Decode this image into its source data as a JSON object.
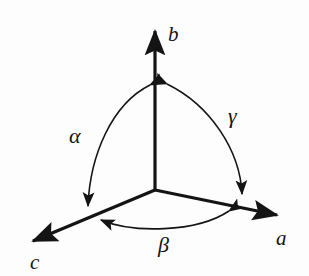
{
  "figure": {
    "background_color": "#fdfdfd",
    "stroke_color": "#141414",
    "axis_stroke_width": 3.2,
    "arc_stroke_width": 1.6
  },
  "axes": [
    {
      "id": "a",
      "label": "a",
      "direction": "lower-right",
      "origin": {
        "x": 155,
        "y": 190
      },
      "tip": {
        "x": 286,
        "y": 217
      },
      "label_position": {
        "x": 276,
        "y": 228
      }
    },
    {
      "id": "b",
      "label": "b",
      "direction": "up",
      "origin": {
        "x": 155,
        "y": 190
      },
      "tip": {
        "x": 155,
        "y": 22
      },
      "label_position": {
        "x": 168,
        "y": 24
      }
    },
    {
      "id": "c",
      "label": "c",
      "direction": "lower-left",
      "origin": {
        "x": 155,
        "y": 190
      },
      "tip": {
        "x": 24,
        "y": 245
      },
      "label_position": {
        "x": 30,
        "y": 252
      }
    }
  ],
  "angles": [
    {
      "id": "alpha",
      "label": "α",
      "between": [
        "b",
        "c"
      ],
      "arc_from": {
        "x": 150,
        "y": 78
      },
      "arc_to": {
        "x": 88,
        "y": 214
      },
      "bulge": "left",
      "arrowheads": [
        "both"
      ],
      "label_position": {
        "x": 69,
        "y": 125
      }
    },
    {
      "id": "beta",
      "label": "β",
      "between": [
        "c",
        "a"
      ],
      "arc_from": {
        "x": 236,
        "y": 209
      },
      "arc_to": {
        "x": 94,
        "y": 219
      },
      "bulge": "down",
      "arrowheads": [
        "both"
      ],
      "label_position": {
        "x": 158,
        "y": 234
      }
    },
    {
      "id": "gamma",
      "label": "γ",
      "between": [
        "b",
        "a"
      ],
      "arc_from": {
        "x": 161,
        "y": 78
      },
      "arc_to": {
        "x": 242,
        "y": 202
      },
      "bulge": "right",
      "arrowheads": [
        "both"
      ],
      "label_position": {
        "x": 228,
        "y": 105
      }
    }
  ]
}
